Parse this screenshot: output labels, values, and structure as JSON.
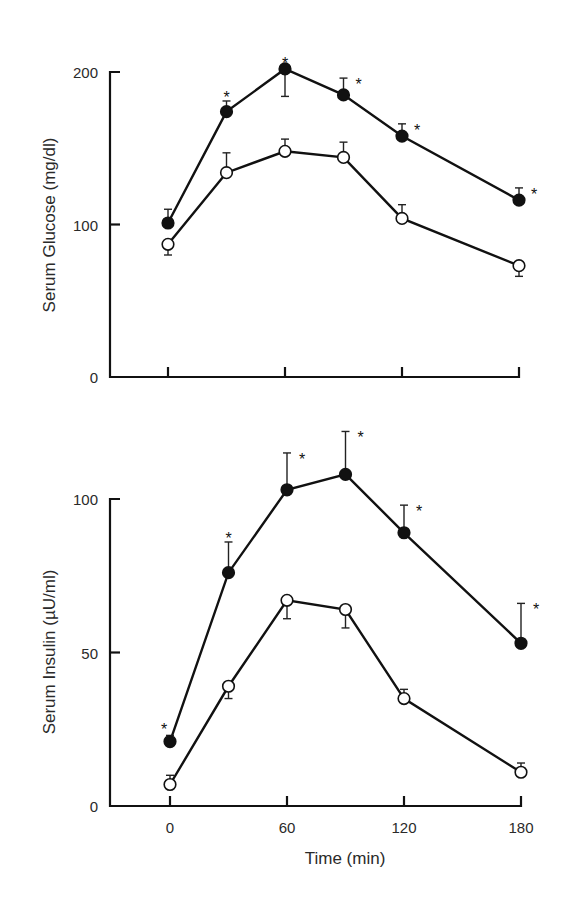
{
  "chart_data": [
    {
      "type": "line",
      "title": "",
      "xlabel": "",
      "ylabel": "Serum Glucose (mg/dl)",
      "ylim": [
        0,
        200
      ],
      "yticks": [
        0,
        100,
        200
      ],
      "xticks": [
        0,
        60,
        120,
        180
      ],
      "show_xtick_labels": false,
      "grid": false,
      "legend": "none",
      "x": [
        0,
        30,
        60,
        90,
        120,
        180
      ],
      "series": [
        {
          "name": "filled-circles",
          "marker": "filled",
          "values": [
            101,
            174,
            202,
            185,
            158,
            116
          ],
          "error_up": [
            9,
            7,
            0,
            11,
            8,
            8
          ],
          "error_down": [
            0,
            0,
            18,
            0,
            0,
            0
          ],
          "significant": [
            false,
            true,
            true,
            true,
            true,
            true
          ]
        },
        {
          "name": "open-circles",
          "marker": "open",
          "values": [
            87,
            134,
            148,
            144,
            104,
            73
          ],
          "error_up": [
            0,
            13,
            8,
            10,
            9,
            0
          ],
          "error_down": [
            7,
            0,
            0,
            0,
            0,
            7
          ],
          "significant": [
            false,
            false,
            false,
            false,
            false,
            false
          ]
        }
      ]
    },
    {
      "type": "line",
      "title": "",
      "xlabel": "Time (min)",
      "ylabel": "Serum Insulin (µU/ml)",
      "ylim": [
        0,
        100
      ],
      "yticks": [
        0,
        50,
        100
      ],
      "xticks": [
        0,
        60,
        120,
        180
      ],
      "show_xtick_labels": true,
      "grid": false,
      "legend": "none",
      "x": [
        0,
        30,
        60,
        90,
        120,
        180
      ],
      "series": [
        {
          "name": "filled-circles",
          "marker": "filled",
          "values": [
            21,
            76,
            103,
            108,
            89,
            53
          ],
          "error_up": [
            2,
            10,
            12,
            14,
            9,
            13
          ],
          "error_down": [
            0,
            0,
            0,
            0,
            0,
            0
          ],
          "significant": [
            true,
            true,
            true,
            true,
            true,
            true
          ]
        },
        {
          "name": "open-circles",
          "marker": "open",
          "values": [
            7,
            39,
            67,
            64,
            35,
            11
          ],
          "error_up": [
            3,
            0,
            0,
            0,
            3,
            3
          ],
          "error_down": [
            0,
            4,
            6,
            6,
            0,
            0
          ],
          "significant": [
            false,
            false,
            false,
            false,
            false,
            false
          ]
        }
      ]
    }
  ],
  "labels": {
    "top_ylabel": "Serum Glucose (mg/dl)",
    "bottom_ylabel": "Serum Insulin (µU/ml)",
    "xlabel": "Time (min)",
    "significance_marker": "*"
  }
}
